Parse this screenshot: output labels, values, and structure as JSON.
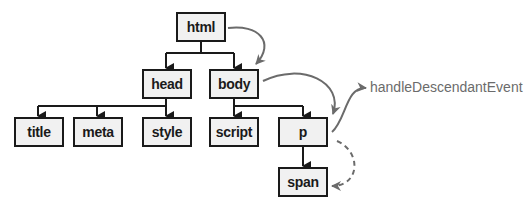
{
  "diagram": {
    "type": "dom-tree-event-propagation",
    "nodes": [
      {
        "id": "html",
        "label": "html"
      },
      {
        "id": "head",
        "label": "head"
      },
      {
        "id": "body",
        "label": "body"
      },
      {
        "id": "title",
        "label": "title"
      },
      {
        "id": "meta",
        "label": "meta"
      },
      {
        "id": "style",
        "label": "style"
      },
      {
        "id": "script",
        "label": "script"
      },
      {
        "id": "p",
        "label": "p"
      },
      {
        "id": "span",
        "label": "span"
      }
    ],
    "edges": [
      {
        "from": "html",
        "to": "head"
      },
      {
        "from": "html",
        "to": "body"
      },
      {
        "from": "head",
        "to": "title"
      },
      {
        "from": "head",
        "to": "meta"
      },
      {
        "from": "head",
        "to": "style"
      },
      {
        "from": "body",
        "to": "script"
      },
      {
        "from": "body",
        "to": "p"
      },
      {
        "from": "p",
        "to": "span"
      }
    ],
    "flow_arrows": [
      {
        "from": "html",
        "to": "body",
        "style": "solid",
        "color": "#6b6b6b"
      },
      {
        "from": "body",
        "to": "p",
        "style": "solid",
        "color": "#6b6b6b"
      },
      {
        "from": "p",
        "to": "handler",
        "style": "solid",
        "color": "#6b6b6b"
      },
      {
        "from": "p",
        "to": "span",
        "style": "dashed",
        "color": "#6b6b6b"
      }
    ],
    "handler_label": "handleDescendantEvent",
    "colors": {
      "box_border": "#1a1a1a",
      "box_fill": "#f1f1f1",
      "tree_line": "#1a1a1a",
      "flow_arrow": "#6b6b6b"
    }
  }
}
